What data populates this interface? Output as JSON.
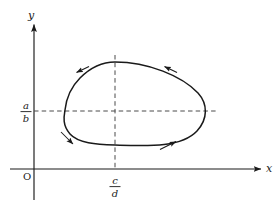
{
  "figure": {
    "kind": "phase-plane-closed-orbit",
    "background_color": "#ffffff",
    "stroke_color": "#1a1a1a",
    "dash_color": "#555555"
  },
  "axes": {
    "x_axis_label": "x",
    "y_axis_label": "y",
    "origin_label": "O"
  },
  "ticks": {
    "y_value": {
      "numerator": "a",
      "denominator": "b"
    },
    "x_value": {
      "numerator": "c",
      "denominator": "d"
    }
  },
  "guides": {
    "horizontal_dashed_label": "y = a/b",
    "vertical_dashed_label": "x = c/d"
  },
  "orbit": {
    "description": "closed periodic orbit",
    "direction": "counterclockwise",
    "arrow_count": 4,
    "arrows": [
      {
        "name": "top-left-flow-arrow",
        "direction": "up-left"
      },
      {
        "name": "top-right-flow-arrow",
        "direction": "up-left"
      },
      {
        "name": "bottom-left-flow-arrow",
        "direction": "down-right"
      },
      {
        "name": "bottom-right-flow-arrow",
        "direction": "up-right"
      }
    ]
  }
}
